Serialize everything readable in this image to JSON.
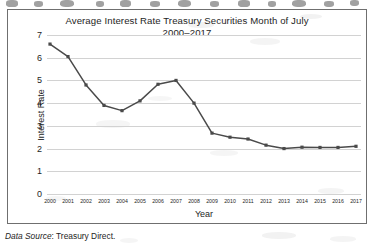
{
  "figure": {
    "title_line1": "Average Interest Rate Treasury Securities Month of July",
    "title_line2": "2000–2017",
    "caption_label": "Data Source",
    "caption_rest": ": Treasury Direct."
  },
  "chart_data": {
    "type": "line",
    "title": "Average Interest Rate Treasury Securities Month of July 2000–2017",
    "xlabel": "Year",
    "ylabel": "Interest Rate",
    "categories": [
      "2000",
      "2001",
      "2002",
      "2003",
      "2004",
      "2005",
      "2006",
      "2007",
      "2008",
      "2009",
      "2010",
      "2011",
      "2012",
      "2013",
      "2014",
      "2015",
      "2016",
      "2017"
    ],
    "values": [
      6.6,
      6.05,
      4.8,
      3.9,
      3.67,
      4.1,
      4.83,
      5.0,
      4.0,
      2.68,
      2.5,
      2.42,
      2.15,
      2.0,
      2.06,
      2.05,
      2.05,
      2.1
    ],
    "ylim": [
      0,
      7
    ],
    "yticks": [
      0,
      1,
      2,
      3,
      4,
      5,
      6,
      7
    ],
    "ytick_labels": [
      "0",
      "1",
      "2",
      "3",
      "4",
      "5",
      "6",
      "7"
    ],
    "grid": "horizontal",
    "legend": "none",
    "series_color": "#4a4a4a",
    "grid_color": "#d2d2d2",
    "marker": "square"
  }
}
